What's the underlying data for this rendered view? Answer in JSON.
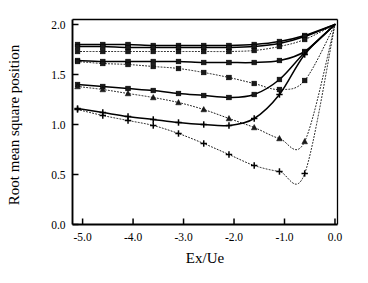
{
  "chart_data": {
    "type": "line",
    "title": "",
    "subtitle": "",
    "xlabel": "Ex/Ue",
    "ylabel": "Root mean square position",
    "xlim": [
      -5.2,
      0.05
    ],
    "ylim": [
      0.0,
      2.05
    ],
    "xticks": [
      -5.0,
      -4.0,
      -3.0,
      -2.0,
      -1.0,
      0.0
    ],
    "xticklabels": [
      "-5.0",
      "-4.0",
      "-3.0",
      "-2.0",
      "-1.0",
      "0.0"
    ],
    "yticks": [
      0.0,
      0.5,
      1.0,
      1.5,
      2.0
    ],
    "yticklabels": [
      "0.0",
      "0.5",
      "1.0",
      "1.5",
      "2.0"
    ],
    "grid": false,
    "legend": "none",
    "legend_position": "none",
    "annotations": [],
    "line_color": "#000000",
    "marker_color": "#000000",
    "background_color": "#ffffff",
    "series": [
      {
        "name": "solid-1",
        "style": "solid",
        "marker": "square",
        "x": [
          -5.1,
          -4.6,
          -4.1,
          -3.6,
          -3.1,
          -2.6,
          -2.1,
          -1.6,
          -1.1,
          -0.6,
          0.0
        ],
        "values": [
          1.8,
          1.8,
          1.8,
          1.79,
          1.79,
          1.79,
          1.79,
          1.8,
          1.83,
          1.89,
          2.0
        ]
      },
      {
        "name": "solid-2",
        "style": "solid",
        "marker": "square",
        "x": [
          -5.1,
          -4.6,
          -4.1,
          -3.6,
          -3.1,
          -2.6,
          -2.1,
          -1.6,
          -1.1,
          -0.6,
          0.0
        ],
        "values": [
          1.78,
          1.78,
          1.77,
          1.77,
          1.77,
          1.77,
          1.77,
          1.78,
          1.81,
          1.88,
          2.0
        ]
      },
      {
        "name": "dotted-1",
        "style": "dotted",
        "marker": "square",
        "x": [
          -5.1,
          -4.6,
          -4.1,
          -3.6,
          -3.1,
          -2.6,
          -2.1,
          -1.6,
          -1.1,
          -0.6,
          0.0
        ],
        "values": [
          1.73,
          1.73,
          1.73,
          1.73,
          1.73,
          1.73,
          1.73,
          1.74,
          1.78,
          1.85,
          2.0
        ]
      },
      {
        "name": "solid-3",
        "style": "solid",
        "marker": "square",
        "x": [
          -5.1,
          -4.6,
          -4.1,
          -3.6,
          -3.1,
          -2.6,
          -2.1,
          -1.6,
          -1.1,
          -0.6,
          0.0
        ],
        "values": [
          1.64,
          1.63,
          1.63,
          1.63,
          1.63,
          1.62,
          1.62,
          1.62,
          1.64,
          1.73,
          2.0
        ]
      },
      {
        "name": "dotted-2",
        "style": "dotted",
        "marker": "square",
        "x": [
          -5.1,
          -4.6,
          -4.1,
          -3.6,
          -3.1,
          -2.6,
          -2.1,
          -1.6,
          -1.1,
          -0.6,
          0.0
        ],
        "values": [
          1.63,
          1.61,
          1.6,
          1.58,
          1.56,
          1.52,
          1.47,
          1.41,
          1.35,
          1.44,
          2.0
        ]
      },
      {
        "name": "solid-4",
        "style": "solid",
        "marker": "square",
        "x": [
          -5.1,
          -4.6,
          -4.1,
          -3.6,
          -3.1,
          -2.6,
          -2.1,
          -1.6,
          -1.1,
          -0.6,
          0.0
        ],
        "values": [
          1.4,
          1.38,
          1.36,
          1.34,
          1.31,
          1.29,
          1.27,
          1.3,
          1.45,
          1.72,
          2.0
        ]
      },
      {
        "name": "dotted-3",
        "style": "dotted",
        "marker": "triangle",
        "x": [
          -5.1,
          -4.6,
          -4.1,
          -3.6,
          -3.1,
          -2.6,
          -2.1,
          -1.6,
          -1.1,
          -0.6,
          0.0
        ],
        "values": [
          1.38,
          1.35,
          1.31,
          1.27,
          1.22,
          1.15,
          1.06,
          0.97,
          0.86,
          0.83,
          2.0
        ]
      },
      {
        "name": "solid-5",
        "style": "solid",
        "marker": "plus",
        "x": [
          -5.1,
          -4.6,
          -4.1,
          -3.6,
          -3.1,
          -2.6,
          -2.1,
          -1.6,
          -1.1,
          -0.6,
          0.0
        ],
        "values": [
          1.16,
          1.12,
          1.08,
          1.05,
          1.02,
          1.0,
          0.99,
          1.06,
          1.3,
          1.7,
          2.0
        ]
      },
      {
        "name": "dotted-4",
        "style": "dotted",
        "marker": "plus",
        "x": [
          -5.1,
          -4.6,
          -4.1,
          -3.6,
          -3.1,
          -2.6,
          -2.1,
          -1.6,
          -1.1,
          -0.6,
          0.0
        ],
        "values": [
          1.15,
          1.09,
          1.04,
          0.99,
          0.91,
          0.81,
          0.7,
          0.59,
          0.53,
          0.51,
          2.0
        ]
      }
    ]
  }
}
